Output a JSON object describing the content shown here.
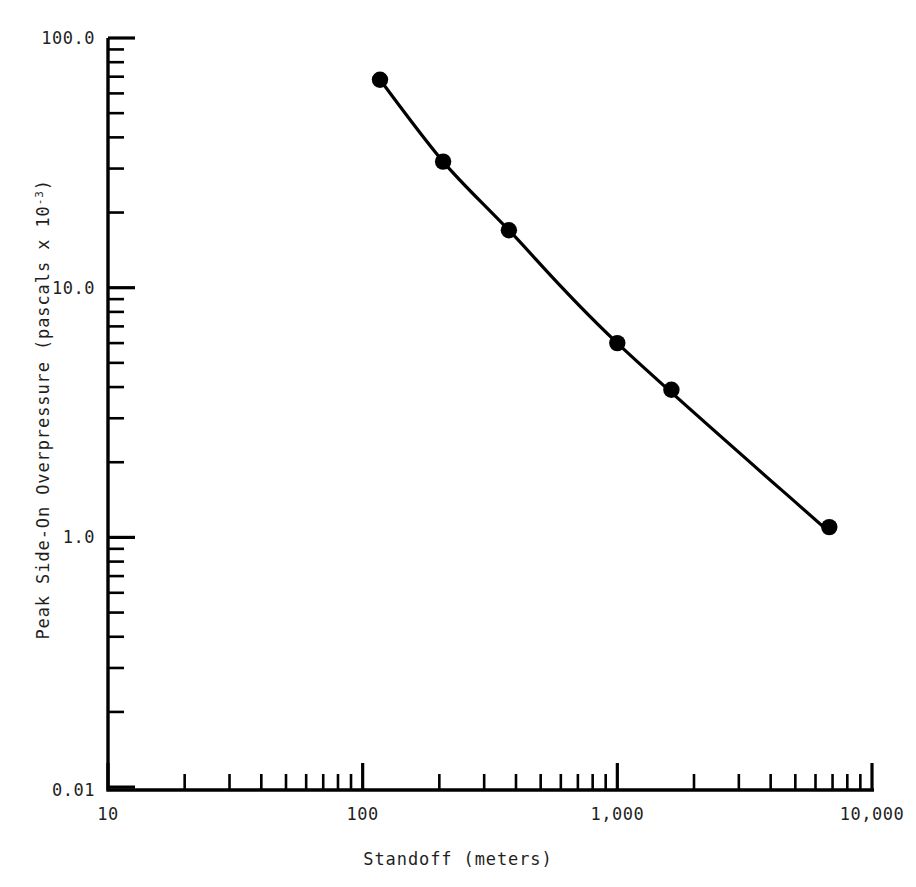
{
  "chart_data": {
    "type": "line",
    "title": "",
    "xlabel": "Standoff (meters)",
    "ylabel": "Peak Side-On Overpressure (pascals x 10-3)",
    "ylabel_base": "Peak Side-On Overpressure (pascals x 10",
    "ylabel_exponent": "-3",
    "ylabel_tail": ")",
    "xscale": "log",
    "yscale": "log",
    "xlim": [
      10,
      10000
    ],
    "ylim": [
      0.01,
      100.0
    ],
    "grid": false,
    "legend": false,
    "x_tick_labels": [
      "10",
      "100",
      "1,000",
      "10,000"
    ],
    "x_tick_values": [
      10,
      100,
      1000,
      10000
    ],
    "y_tick_labels": [
      "100.0",
      "10.0",
      "1.0",
      "0.01"
    ],
    "y_tick_values": [
      100.0,
      10.0,
      1.0,
      0.01
    ],
    "series": [
      {
        "name": "Peak side-on overpressure vs standoff",
        "marker": "filled-circle",
        "x": [
          117,
          207,
          375,
          1000,
          1630,
          6800
        ],
        "y": [
          68.0,
          32.0,
          17.0,
          6.0,
          3.9,
          1.1
        ]
      }
    ],
    "curve_x": [
      117,
      207,
      375,
      1000,
      6800
    ],
    "curve_y": [
      68.0,
      32.0,
      17.0,
      6.0,
      1.05
    ]
  },
  "axes": {
    "line_color": "#000000",
    "text_color": "#1f1f1f"
  }
}
